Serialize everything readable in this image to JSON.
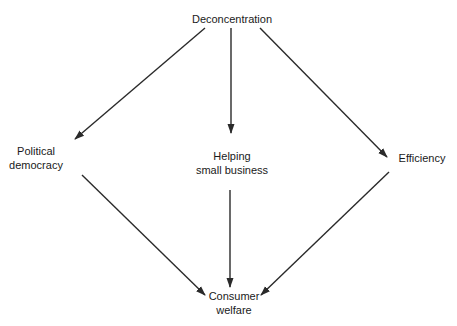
{
  "diagram": {
    "type": "flow",
    "nodes": {
      "top": {
        "lines": [
          "Deconcentration"
        ]
      },
      "left": {
        "lines": [
          "Political",
          "democracy"
        ]
      },
      "center": {
        "lines": [
          "Helping",
          "small business"
        ]
      },
      "right": {
        "lines": [
          "Efficiency"
        ]
      },
      "bottom": {
        "lines": [
          "Consumer",
          "welfare"
        ]
      }
    },
    "edges": [
      {
        "from": "Deconcentration",
        "to": "Political democracy"
      },
      {
        "from": "Deconcentration",
        "to": "Helping small business"
      },
      {
        "from": "Deconcentration",
        "to": "Efficiency"
      },
      {
        "from": "Political democracy",
        "to": "Consumer welfare"
      },
      {
        "from": "Helping small business",
        "to": "Consumer welfare"
      },
      {
        "from": "Efficiency",
        "to": "Consumer welfare"
      }
    ],
    "line_color": "#2a2a2a"
  }
}
